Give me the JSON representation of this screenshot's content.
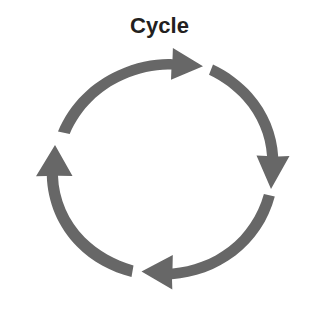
{
  "diagram": {
    "type": "cycle",
    "title": "Cycle",
    "title_color": "#231f20",
    "background_color": "#ffffff",
    "arrow_color": "#676767",
    "direction": "clockwise",
    "segment_count": 4,
    "center": {
      "x": 160,
      "y": 176
    },
    "radius": 95,
    "band_width": 17,
    "segments": [
      {
        "name": "segment-top",
        "label": "",
        "start_angle_deg": 190,
        "end_angle_deg": 275,
        "arrowhead_position": "end",
        "arrowhead_direction": "right"
      },
      {
        "name": "segment-right",
        "label": "",
        "start_angle_deg": 285,
        "end_angle_deg": 10,
        "arrowhead_position": "end",
        "arrowhead_direction": "down"
      },
      {
        "name": "segment-bottom",
        "label": "",
        "start_angle_deg": 20,
        "end_angle_deg": 103,
        "arrowhead_position": "end",
        "arrowhead_direction": "left"
      },
      {
        "name": "segment-left",
        "label": "",
        "start_angle_deg": 113,
        "end_angle_deg": 182,
        "arrowhead_position": "end",
        "arrowhead_direction": "up"
      }
    ]
  }
}
